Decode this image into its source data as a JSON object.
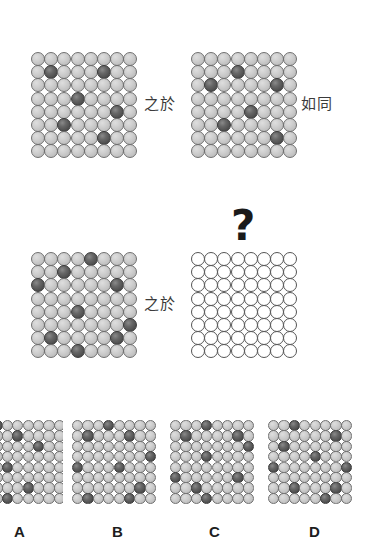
{
  "puzzle": {
    "type": "visual-analogy-matrix",
    "grid_size": {
      "rows": 8,
      "cols": 8
    },
    "colors": {
      "light_ball": "#c8c8c8",
      "dark_ball": "#555555",
      "outline": "#6f6f6f",
      "empty_fill": "#ffffff",
      "text": "#3b3b3b",
      "background": "#ffffff"
    },
    "relation_word_1": "之於",
    "relation_word_2": "如同",
    "question_mark": "?"
  },
  "panels": {
    "a": {
      "name": "panel-a",
      "state": "filled",
      "dark_count": 6,
      "dark_cells": [
        [
          1,
          1
        ],
        [
          1,
          5
        ],
        [
          3,
          3
        ],
        [
          4,
          6
        ],
        [
          5,
          2
        ],
        [
          6,
          5
        ]
      ]
    },
    "b": {
      "name": "panel-b",
      "state": "filled",
      "dark_count": 6,
      "dark_cells": [
        [
          1,
          3
        ],
        [
          2,
          1
        ],
        [
          2,
          6
        ],
        [
          4,
          4
        ],
        [
          5,
          2
        ],
        [
          6,
          6
        ]
      ]
    },
    "c": {
      "name": "panel-c",
      "state": "filled",
      "dark_count": 9,
      "dark_cells": [
        [
          0,
          4
        ],
        [
          1,
          2
        ],
        [
          2,
          0
        ],
        [
          2,
          6
        ],
        [
          4,
          3
        ],
        [
          5,
          7
        ],
        [
          6,
          1
        ],
        [
          6,
          6
        ],
        [
          7,
          3
        ]
      ]
    },
    "d": {
      "name": "panel-d-unknown",
      "state": "empty",
      "dark_count": 0,
      "dark_cells": []
    }
  },
  "options": [
    {
      "label": "A",
      "name": "option-a",
      "clipped_left": true,
      "dark_cells": [
        [
          0,
          1
        ],
        [
          1,
          3
        ],
        [
          2,
          5
        ],
        [
          4,
          2
        ],
        [
          6,
          4
        ],
        [
          7,
          2
        ]
      ]
    },
    {
      "label": "B",
      "name": "option-b",
      "clipped_left": false,
      "dark_cells": [
        [
          0,
          3
        ],
        [
          1,
          1
        ],
        [
          1,
          5
        ],
        [
          3,
          7
        ],
        [
          4,
          0
        ],
        [
          4,
          4
        ],
        [
          6,
          6
        ],
        [
          7,
          1
        ],
        [
          7,
          5
        ]
      ]
    },
    {
      "label": "C",
      "name": "option-c",
      "clipped_left": false,
      "dark_cells": [
        [
          0,
          3
        ],
        [
          1,
          1
        ],
        [
          1,
          6
        ],
        [
          2,
          7
        ],
        [
          3,
          3
        ],
        [
          5,
          0
        ],
        [
          5,
          6
        ],
        [
          6,
          2
        ],
        [
          7,
          3
        ]
      ]
    },
    {
      "label": "D",
      "name": "option-d",
      "clipped_left": false,
      "dark_cells": [
        [
          0,
          2
        ],
        [
          1,
          6
        ],
        [
          2,
          1
        ],
        [
          3,
          4
        ],
        [
          4,
          0
        ],
        [
          4,
          7
        ],
        [
          6,
          2
        ],
        [
          6,
          6
        ],
        [
          7,
          5
        ]
      ]
    }
  ]
}
